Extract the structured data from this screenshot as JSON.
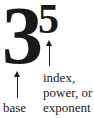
{
  "diagram": {
    "base_digit": "3",
    "exponent_digit": "5",
    "base_label": "base",
    "exponent_label_lines": [
      "index,",
      "power, or",
      "exponent"
    ]
  }
}
